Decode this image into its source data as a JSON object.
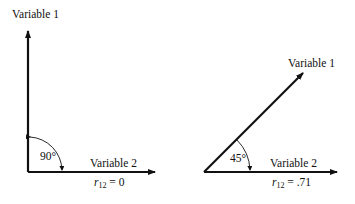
{
  "diagrams": [
    {
      "id": "uncorrelated",
      "vector_a_label": "Variable 1",
      "vector_b_label": "Variable 2",
      "angle_label": "90°",
      "correlation": {
        "symbol": "r",
        "subscript": "12",
        "equals": "= 0"
      }
    },
    {
      "id": "correlated",
      "vector_a_label": "Variable 1",
      "vector_b_label": "Variable 2",
      "angle_label": "45°",
      "correlation": {
        "symbol": "r",
        "subscript": "12",
        "equals": "= .71"
      }
    }
  ],
  "colors": {
    "ink": "#111111",
    "background": "#ffffff"
  }
}
